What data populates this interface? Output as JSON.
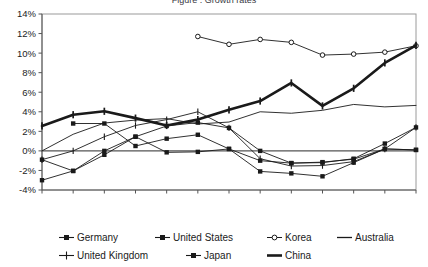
{
  "title": {
    "text": "Figure : Growth rates"
  },
  "chart_data": {
    "type": "line",
    "title": "Figure : Growth rates",
    "xlabel": "",
    "ylabel": "",
    "x": [
      1995,
      1996,
      1997,
      1998,
      1999,
      2000,
      2001,
      2002,
      2003,
      2004,
      2005,
      2006,
      2007
    ],
    "xticklabels": [
      "1995",
      "1996",
      "1997",
      "1998",
      "1999",
      "2000",
      "2001",
      "2002",
      "2003",
      "2004",
      "2005",
      "2006",
      "2007"
    ],
    "yticklabels": [
      "14%",
      "12%",
      "10%",
      "8%",
      "6%",
      "4%",
      "2%",
      "0%",
      "-2%",
      "-4%"
    ],
    "yticks": [
      14,
      12,
      10,
      8,
      6,
      4,
      2,
      0,
      -2,
      -4
    ],
    "ylim": [
      -4,
      14
    ],
    "xlim": [
      1995,
      2007
    ],
    "grid": false,
    "legend_position": "bottom",
    "series": [
      {
        "name": "Germany",
        "marker": "filled-square",
        "line": "thin",
        "x": [
          1996,
          1997,
          1998,
          1999,
          2000,
          2001,
          2002,
          2003,
          2004,
          2005,
          2006,
          2007
        ],
        "values": [
          2.8,
          2.8,
          0.5,
          1.25,
          1.65,
          0.2,
          -1.0,
          -1.25,
          -1.2,
          -0.8,
          0.75,
          2.4
        ]
      },
      {
        "name": "United States",
        "marker": "filled-square",
        "line": "thin",
        "x": [
          1995,
          1996,
          1997,
          1998,
          1999,
          2000,
          2001,
          2002,
          2003,
          2004,
          2005,
          2006,
          2007
        ],
        "values": [
          -0.9,
          -2.05,
          -0.4,
          1.45,
          2.55,
          2.9,
          2.35,
          0.0,
          -1.25,
          -1.15,
          -0.85,
          0.2,
          0.1
        ]
      },
      {
        "name": "Korea",
        "marker": "open-circle",
        "line": "thin",
        "x": [
          2000,
          2001,
          2002,
          2003,
          2004,
          2005,
          2006,
          2007
        ],
        "values": [
          11.7,
          10.9,
          11.4,
          11.1,
          9.8,
          9.9,
          10.1,
          10.75
        ]
      },
      {
        "name": "Australia",
        "marker": "none",
        "line": "thin",
        "x": [
          1995,
          1996,
          1997,
          1998,
          1999,
          2000,
          2001,
          2002,
          2003,
          2004,
          2005,
          2006,
          2007
        ],
        "values": [
          0.0,
          1.7,
          2.85,
          3.15,
          3.3,
          2.75,
          2.95,
          4.0,
          3.85,
          4.15,
          4.75,
          4.5,
          4.65
        ]
      },
      {
        "name": "United Kingdom",
        "marker": "plus",
        "line": "thin",
        "x": [
          1995,
          1996,
          1997,
          1998,
          1999,
          2000,
          2001,
          2002,
          2003,
          2004,
          2005,
          2006,
          2007
        ],
        "values": [
          -0.9,
          0.0,
          1.45,
          2.6,
          3.2,
          4.0,
          2.35,
          -0.8,
          -1.55,
          -1.5,
          -1.1,
          0.2,
          2.4
        ]
      },
      {
        "name": "Japan",
        "marker": "filled-square",
        "line": "thin",
        "x": [
          1995,
          1996,
          1997,
          1998,
          1999,
          2000,
          2001,
          2002,
          2003,
          2004,
          2005,
          2006,
          2007
        ],
        "values": [
          -3.0,
          -2.05,
          0.0,
          1.45,
          -0.15,
          -0.1,
          0.2,
          -2.1,
          -2.3,
          -2.6,
          -1.2,
          0.2,
          0.1
        ]
      },
      {
        "name": "China",
        "marker": "plus",
        "line": "thick",
        "x": [
          1995,
          1996,
          1997,
          1998,
          1999,
          2000,
          2001,
          2002,
          2003,
          2004,
          2005,
          2006,
          2007
        ],
        "values": [
          2.55,
          3.7,
          4.05,
          3.35,
          2.6,
          3.2,
          4.2,
          5.1,
          6.95,
          4.6,
          6.4,
          9.0,
          10.8
        ]
      }
    ]
  },
  "legend": {
    "row1": [
      {
        "label": "Germany",
        "marker": "filled-square"
      },
      {
        "label": "United States",
        "marker": "filled-square"
      },
      {
        "label": "Korea",
        "marker": "open-circle"
      },
      {
        "label": "Australia",
        "marker": "none"
      }
    ],
    "row2": [
      {
        "label": "United Kingdom",
        "marker": "plus"
      },
      {
        "label": "Japan",
        "marker": "filled-square"
      },
      {
        "label": "China",
        "marker": "plus-thick"
      }
    ]
  },
  "colors": {
    "line": "#1a1a1a",
    "axis": "#555555",
    "frame": "#9a9a9a",
    "text": "#222222",
    "background": "#ffffff"
  }
}
